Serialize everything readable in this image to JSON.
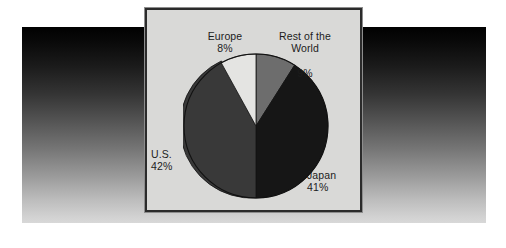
{
  "chart_data": {
    "type": "pie",
    "title": "",
    "categories": [
      "Europe",
      "Rest of the World",
      "Japan",
      "U.S."
    ],
    "values": [
      8,
      9,
      41,
      42
    ],
    "value_labels": [
      "8%",
      "9%",
      "41%",
      "42%"
    ],
    "unit": "%",
    "total": 100,
    "legend": "none",
    "grid": false,
    "start_angle_deg": 0,
    "direction": "clockwise",
    "slices": [
      {
        "name": "Rest of the World",
        "label": "Rest of the\nWorld",
        "value": 9,
        "value_label": "9%",
        "color": "#6d6d6d",
        "start_deg": 0,
        "end_deg": 32.4,
        "label_position": "top-right"
      },
      {
        "name": "Japan",
        "label": "Japan",
        "value": 41,
        "value_label": "41%",
        "color": "#161616",
        "start_deg": 32.4,
        "end_deg": 180.0,
        "label_position": "right"
      },
      {
        "name": "U.S.",
        "label": "U.S.",
        "value": 42,
        "value_label": "42%",
        "color": "#393939",
        "start_deg": 180.0,
        "end_deg": 331.2,
        "label_position": "left"
      },
      {
        "name": "Europe",
        "label": "Europe",
        "value": 8,
        "value_label": "8%",
        "color": "#e4e4e2",
        "start_deg": 331.2,
        "end_deg": 360.0,
        "label_position": "top-left"
      }
    ]
  },
  "labels": {
    "europe": {
      "name": "Europe",
      "pct": "8%"
    },
    "rest_of_world": {
      "name_line1": "Rest of the",
      "name_line2": "World",
      "pct": "9%"
    },
    "us": {
      "name": "U.S.",
      "pct": "42%"
    },
    "japan": {
      "name": "Japan",
      "pct": "41%"
    }
  },
  "style": {
    "panel_background": "#d9d9d7",
    "panel_border": "#2b2b2b",
    "page_background": "#ffffff",
    "backdrop_top": "#010101",
    "backdrop_bottom": "#d8d8d8",
    "text_color": "#1c1c1c",
    "pie_outline": "#111111"
  }
}
